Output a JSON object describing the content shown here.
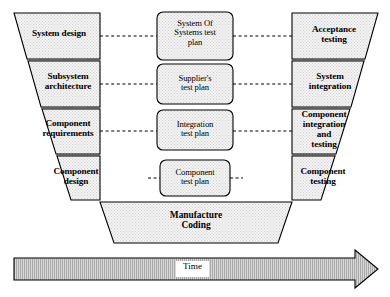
{
  "diagram": {
    "type": "v-model",
    "colors": {
      "outline": "#000000",
      "shape_fill": "#f2f2f2",
      "arrow_fill": "#b3b3b3",
      "background": "#ffffff",
      "divider": "#555555"
    },
    "left_arm": {
      "name": "development-side",
      "stages": [
        {
          "id": "system-design",
          "label": "System design"
        },
        {
          "id": "subsystem-architecture",
          "label": "Subsystem\narchitecture"
        },
        {
          "id": "component-requirements",
          "label": "Component\nrequirements"
        },
        {
          "id": "component-design",
          "label": "Component\ndesign"
        }
      ]
    },
    "center_plans": {
      "name": "test-plans",
      "items": [
        {
          "id": "system-of-systems-test-plan",
          "label": "System Of\nSystems test\nplan"
        },
        {
          "id": "suppliers-test-plan",
          "label": "Supplier's\ntest plan"
        },
        {
          "id": "integration-test-plan",
          "label": "Integration\ntest plan"
        },
        {
          "id": "component-test-plan",
          "label": "Component\ntest plan"
        }
      ]
    },
    "right_arm": {
      "name": "verification-side",
      "stages": [
        {
          "id": "acceptance-testing",
          "label": "Acceptance\ntesting"
        },
        {
          "id": "system-integration",
          "label": "System\nintegration"
        },
        {
          "id": "component-integration-and-testing",
          "label": "Component\nintegration\nand\ntesting"
        },
        {
          "id": "component-testing",
          "label": "Component\ntesting"
        }
      ]
    },
    "bottom": {
      "id": "manufacture-coding",
      "label": "Manufacture\nCoding"
    },
    "time_axis": {
      "id": "time-arrow",
      "label": "Time",
      "direction": "left-to-right"
    }
  }
}
